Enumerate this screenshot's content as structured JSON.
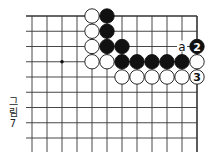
{
  "figure": {
    "caption_chars": [
      "그",
      "림",
      "7"
    ],
    "caption_text": "그림 7"
  },
  "board": {
    "cols": 12,
    "rows": 9,
    "origin_x": 32,
    "origin_y": 16,
    "spacing_x": 15,
    "spacing_y": 15.25,
    "edges": [
      "top",
      "right"
    ],
    "line_color": "#333333",
    "star_points": [
      [
        2,
        3
      ]
    ],
    "stones": [
      {
        "col": 4,
        "row": 0,
        "color": "white"
      },
      {
        "col": 5,
        "row": 0,
        "color": "black"
      },
      {
        "col": 4,
        "row": 1,
        "color": "white"
      },
      {
        "col": 5,
        "row": 1,
        "color": "black"
      },
      {
        "col": 4,
        "row": 2,
        "color": "white"
      },
      {
        "col": 5,
        "row": 2,
        "color": "black"
      },
      {
        "col": 6,
        "row": 2,
        "color": "black"
      },
      {
        "col": 11,
        "row": 2,
        "color": "black",
        "label": "2"
      },
      {
        "col": 4,
        "row": 3,
        "color": "white"
      },
      {
        "col": 5,
        "row": 3,
        "color": "white"
      },
      {
        "col": 6,
        "row": 3,
        "color": "black"
      },
      {
        "col": 7,
        "row": 3,
        "color": "black"
      },
      {
        "col": 8,
        "row": 3,
        "color": "black"
      },
      {
        "col": 9,
        "row": 3,
        "color": "black"
      },
      {
        "col": 10,
        "row": 3,
        "color": "black"
      },
      {
        "col": 11,
        "row": 3,
        "color": "white"
      },
      {
        "col": 6,
        "row": 4,
        "color": "white"
      },
      {
        "col": 7,
        "row": 4,
        "color": "white"
      },
      {
        "col": 8,
        "row": 4,
        "color": "white"
      },
      {
        "col": 9,
        "row": 4,
        "color": "white"
      },
      {
        "col": 10,
        "row": 4,
        "color": "white"
      },
      {
        "col": 11,
        "row": 4,
        "color": "white",
        "label": "3"
      }
    ],
    "marks": [
      {
        "col": 10,
        "row": 2,
        "text": "a"
      }
    ]
  }
}
